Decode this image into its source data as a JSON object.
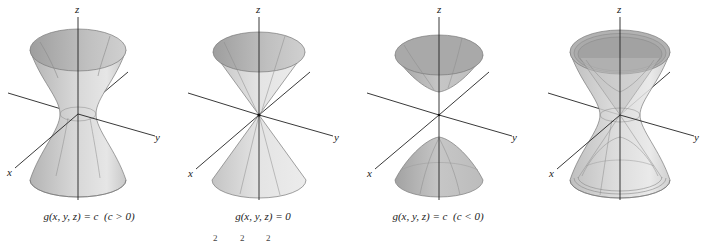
{
  "figure": {
    "panels": [
      {
        "id": "hyperboloid-one-sheet",
        "caption_lhs": "g(x, y, z) = c",
        "caption_cond": "(c > 0)",
        "axis_labels": {
          "x": "x",
          "y": "y",
          "z": "z"
        }
      },
      {
        "id": "double-cone",
        "caption_lhs": "g(x, y, z) = 0",
        "caption_cond": "",
        "axis_labels": {
          "x": "x",
          "y": "y",
          "z": "z"
        }
      },
      {
        "id": "hyperboloid-two-sheets",
        "caption_lhs": "g(x, y, z) = c",
        "caption_cond": "(c < 0)",
        "axis_labels": {
          "x": "x",
          "y": "y",
          "z": "z"
        }
      },
      {
        "id": "combined-level-surfaces",
        "caption_lhs": "",
        "caption_cond": "",
        "axis_labels": {
          "x": "x",
          "y": "y",
          "z": "z"
        }
      }
    ],
    "cutoff_superscripts": [
      "2",
      "2",
      "2"
    ],
    "colors": {
      "surface_light": "#e2e2e2",
      "surface_mid": "#c4c4c4",
      "surface_dark": "#a8a8a8",
      "edge": "#7a7a7a",
      "axis": "#222222"
    }
  }
}
